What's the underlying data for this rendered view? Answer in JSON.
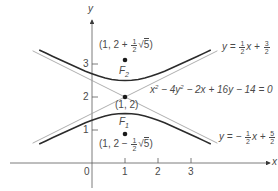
{
  "diagram": {
    "equation": "x² − 4y² − 2x + 16y − 14 = 0",
    "equation_parts": {
      "a": "x",
      "a_exp": "2",
      "b": " − 4y",
      "b_exp": "2",
      "rest": " − 2x + 16y − 14 = 0"
    },
    "axes": {
      "x_label": "x",
      "y_label": "y",
      "origin_label": "0",
      "x_ticks": [
        "1",
        "2",
        "3"
      ],
      "y_ticks": [
        "1",
        "2",
        "3"
      ]
    },
    "center": {
      "label": "(1, 2)",
      "x": 1,
      "y": 2
    },
    "foci": [
      {
        "name": "F",
        "sub": "2",
        "coord_prefix": "(1, 2 + ",
        "frac_num": "1",
        "frac_den": "2",
        "sqrt_arg": "5",
        "coord_suffix": ")",
        "x": 1,
        "y": 3.118
      },
      {
        "name": "F",
        "sub": "1",
        "coord_prefix": "(1, 2 − ",
        "frac_num": "1",
        "frac_den": "2",
        "sqrt_arg": "5",
        "coord_suffix": ")",
        "x": 1,
        "y": 0.882
      }
    ],
    "asymptotes": [
      {
        "prefix": "y = ",
        "frac_num": "1",
        "frac_den": "2",
        "mid": "x + ",
        "frac2_num": "3",
        "frac2_den": "2",
        "slope": 0.5,
        "intercept": 1.5
      },
      {
        "prefix": "y = − ",
        "frac_num": "1",
        "frac_den": "2",
        "mid": "x + ",
        "frac2_num": "5",
        "frac2_den": "2",
        "slope": -0.5,
        "intercept": 2.5
      }
    ],
    "colors": {
      "curve": "#2b2b2b",
      "asymptote": "#9a9a9a",
      "axis": "#5a5a5a",
      "text": "#4a4a4a"
    }
  }
}
